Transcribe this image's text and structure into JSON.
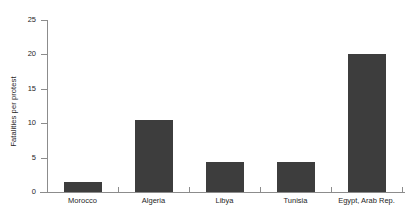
{
  "chart_data": {
    "type": "bar",
    "title": "",
    "subtitle": "",
    "xlabel": "",
    "ylabel": "Fatalities per protest",
    "categories": [
      "Morocco",
      "Algeria",
      "Libya",
      "Tunisia",
      "Egypt, Arab Rep."
    ],
    "values": [
      1.4,
      10.5,
      4.3,
      4.3,
      20.1
    ],
    "ylim": [
      0,
      25
    ],
    "yticks": [
      0,
      5,
      10,
      15,
      20,
      25
    ],
    "ytick_labels": [
      "0",
      "5",
      "10",
      "15",
      "20",
      "25"
    ],
    "grid": false,
    "legend": null,
    "colors": {
      "bar": "#3d3d3d",
      "axis": "#8c8c8c",
      "text": "#262626",
      "background": "#ffffff"
    }
  }
}
